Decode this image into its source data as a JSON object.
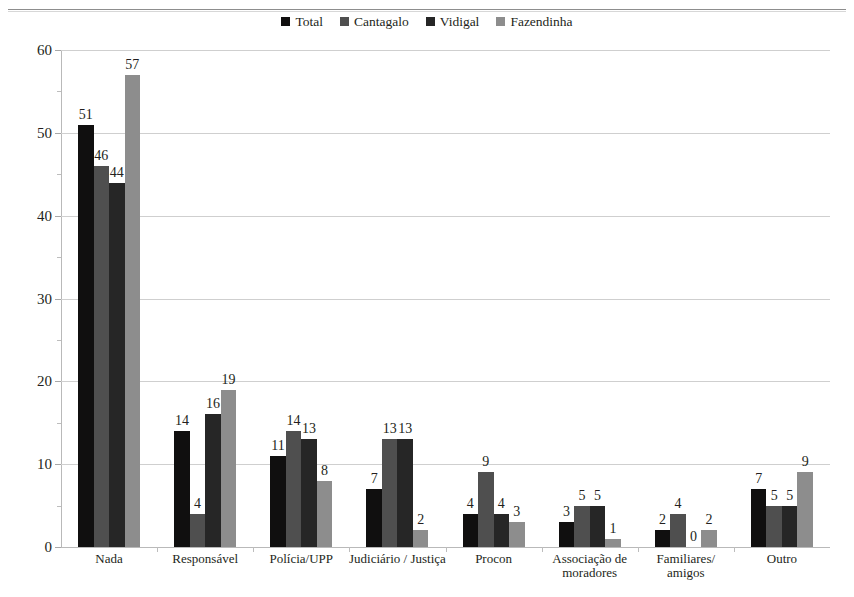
{
  "chart_data": {
    "type": "bar",
    "title": "",
    "xlabel": "",
    "ylabel": "",
    "ylim": [
      0,
      60
    ],
    "ytick_step": 10,
    "yminor_step": 5,
    "grid": "horizontal",
    "legend_position": "top-center",
    "categories": [
      "Nada",
      "Responsável",
      "Polícia/UPP",
      "Judiciário / Justiça",
      "Procon",
      "Associação de\nmoradores",
      "Familiares/\namigos",
      "Outro"
    ],
    "category_lines": [
      [
        "Nada"
      ],
      [
        "Responsável"
      ],
      [
        "Polícia/UPP"
      ],
      [
        "Judiciário / Justiça"
      ],
      [
        "Procon"
      ],
      [
        "Associação de",
        "moradores"
      ],
      [
        "Familiares/",
        "amigos"
      ],
      [
        "Outro"
      ]
    ],
    "ytick_labels": [
      "60",
      "50",
      "40",
      "30",
      "20",
      "10",
      "0"
    ],
    "ytick_values": [
      60,
      50,
      40,
      30,
      20,
      10,
      0
    ],
    "series": [
      {
        "name": "Total",
        "color": "#100f0f",
        "values": [
          51,
          14,
          11,
          7,
          4,
          3,
          2,
          7
        ]
      },
      {
        "name": "Cantagalo",
        "color": "#4f4f4f",
        "values": [
          46,
          4,
          14,
          13,
          9,
          5,
          4,
          5
        ]
      },
      {
        "name": "Vidigal",
        "color": "#262626",
        "values": [
          44,
          16,
          13,
          13,
          4,
          5,
          0,
          5
        ]
      },
      {
        "name": "Fazendinha",
        "color": "#8d8d8d",
        "values": [
          57,
          19,
          8,
          2,
          3,
          1,
          2,
          9
        ]
      }
    ]
  },
  "legend": {
    "items": [
      {
        "label": "Total",
        "color": "#100f0f"
      },
      {
        "label": "Cantagalo",
        "color": "#4f4f4f"
      },
      {
        "label": "Vidigal",
        "color": "#262626"
      },
      {
        "label": "Fazendinha",
        "color": "#8d8d8d"
      }
    ]
  }
}
